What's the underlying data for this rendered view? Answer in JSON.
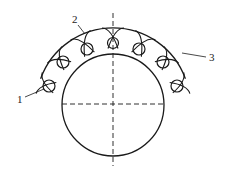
{
  "diagram": {
    "type": "technical-cross-section",
    "stroke_color": "#1a1a1a",
    "background": "#ffffff",
    "main_circle": {
      "cx": 113,
      "cy": 105,
      "r": 51
    },
    "outer_arc": {
      "cx": 113,
      "cy": 105,
      "r": 77,
      "start_deg": 200,
      "end_deg": 340
    },
    "centerlines": {
      "vertical": {
        "x": 113,
        "y1": 13,
        "y2": 166
      },
      "horizontal": {
        "y": 104,
        "x1": 62,
        "x2": 164
      }
    },
    "loops": [
      {
        "cx": 49,
        "cy": 86,
        "r": 6
      },
      {
        "cx": 63,
        "cy": 62,
        "r": 6
      },
      {
        "cx": 87,
        "cy": 49,
        "r": 6
      },
      {
        "cx": 113,
        "cy": 43,
        "r": 5.5
      },
      {
        "cx": 139,
        "cy": 49,
        "r": 6
      },
      {
        "cx": 163,
        "cy": 62,
        "r": 6
      },
      {
        "cx": 177,
        "cy": 86,
        "r": 6
      }
    ],
    "labels": [
      {
        "id": "1",
        "text": "1",
        "x": 17,
        "y": 103,
        "leader": [
          25,
          97,
          44,
          89
        ]
      },
      {
        "id": "2",
        "text": "2",
        "x": 72,
        "y": 23,
        "leader": [
          78,
          25,
          85,
          34
        ]
      },
      {
        "id": "3",
        "text": "3",
        "x": 209,
        "y": 61,
        "leader": [
          182,
          53,
          206,
          57
        ]
      }
    ]
  }
}
